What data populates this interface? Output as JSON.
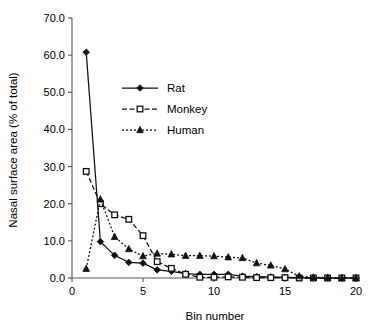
{
  "chart_data": {
    "type": "line",
    "title": "",
    "xlabel": "Bin number",
    "ylabel": "Nasal surface area (% of total)",
    "xlim": [
      0,
      20
    ],
    "ylim": [
      0,
      70
    ],
    "grid": false,
    "legend_position": "inside-upper-left",
    "x_ticks": [
      "0",
      "5",
      "10",
      "15",
      "20"
    ],
    "x_tick_values": [
      0,
      5,
      10,
      15,
      20
    ],
    "y_ticks": [
      "0.0",
      "10.0",
      "20.0",
      "30.0",
      "40.0",
      "50.0",
      "60.0",
      "70.0"
    ],
    "y_tick_values": [
      0,
      10,
      20,
      30,
      40,
      50,
      60,
      70
    ],
    "x": [
      1,
      2,
      3,
      4,
      5,
      6,
      7,
      8,
      9,
      10,
      11,
      12,
      13,
      14,
      15,
      16,
      17,
      18,
      19,
      20
    ],
    "series": [
      {
        "name": "Rat",
        "marker": "filled-diamond",
        "linestyle": "solid",
        "color": "#111111",
        "values": [
          60.8,
          9.8,
          6.1,
          4.2,
          4.0,
          2.2,
          1.8,
          1.2,
          1.0,
          1.0,
          1.0,
          0.5,
          0.4,
          0.3,
          0.2,
          0.1,
          0.0,
          0.0,
          0.0,
          0.0
        ]
      },
      {
        "name": "Monkey",
        "marker": "open-square",
        "linestyle": "dashed",
        "color": "#111111",
        "values": [
          28.7,
          20.0,
          17.0,
          15.8,
          11.4,
          4.4,
          2.6,
          1.0,
          0.2,
          0.2,
          0.3,
          0.2,
          0.1,
          0.1,
          0.1,
          0.0,
          0.0,
          0.0,
          0.0,
          0.0
        ]
      },
      {
        "name": "Human",
        "marker": "filled-triangle",
        "linestyle": "dotted",
        "color": "#111111",
        "values": [
          2.5,
          21.2,
          11.1,
          7.8,
          5.9,
          6.6,
          6.4,
          6.0,
          6.0,
          5.9,
          5.6,
          5.4,
          4.0,
          3.4,
          2.4,
          0.5,
          0.2,
          0.1,
          0.0,
          0.0
        ]
      }
    ]
  },
  "legend": {
    "items": [
      {
        "label": "Rat"
      },
      {
        "label": "Monkey"
      },
      {
        "label": "Human"
      }
    ]
  },
  "axes": {
    "x_title": "Bin number",
    "y_title": "Nasal surface area (% of total)"
  }
}
